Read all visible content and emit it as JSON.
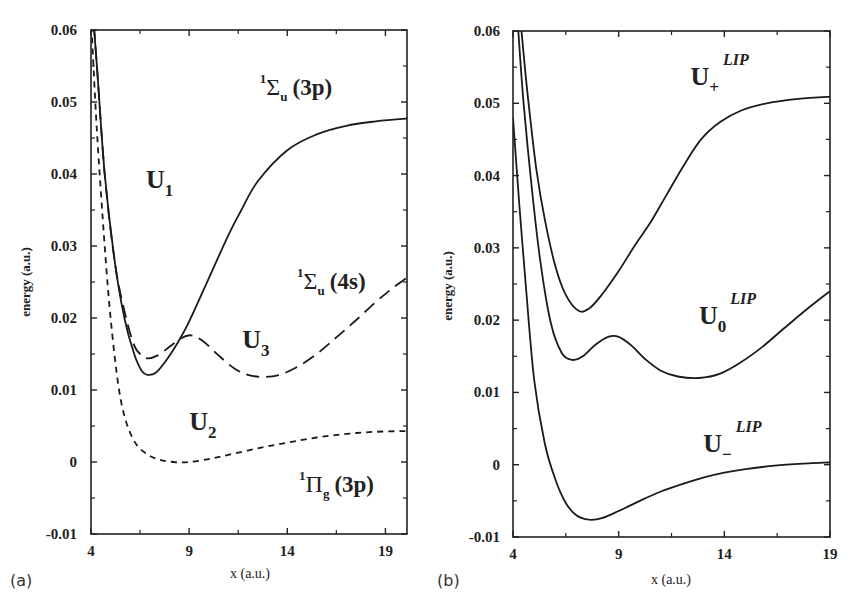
{
  "chart_data": [
    {
      "panel_label": "(a)",
      "type": "line",
      "title": "",
      "xlabel": "x (a.u.)",
      "ylabel": "energy (a.u.)",
      "xlim": [
        4,
        20.1
      ],
      "ylim": [
        -0.01,
        0.06
      ],
      "xticks": [
        4,
        9,
        14,
        19
      ],
      "yticks": [
        -0.01,
        0,
        0.01,
        0.02,
        0.03,
        0.04,
        0.05,
        0.06
      ],
      "ytick_labels": [
        "-0.01",
        "0",
        "0.01",
        "0.02",
        "0.03",
        "0.04",
        "0.05",
        "0.06"
      ],
      "grid": false,
      "legend": "none (inline curve annotations)",
      "series": [
        {
          "name": "U1",
          "state": "1Σu (3p)",
          "style": "solid",
          "x": [
            4.0,
            4.3,
            4.7,
            5.2,
            5.7,
            6.2,
            6.6,
            6.9,
            7.3,
            7.8,
            8.4,
            9.0,
            10.0,
            11.0,
            11.6,
            12.5,
            14.0,
            15.5,
            17.0,
            18.5,
            20.1
          ],
          "y": [
            0.066,
            0.055,
            0.04,
            0.028,
            0.02,
            0.015,
            0.0126,
            0.0121,
            0.0124,
            0.014,
            0.0165,
            0.0195,
            0.0255,
            0.0315,
            0.0347,
            0.039,
            0.0433,
            0.0455,
            0.0467,
            0.0473,
            0.0477
          ]
        },
        {
          "name": "U3",
          "state": "1Σu (4s)",
          "style": "long-dash",
          "x": [
            4.0,
            4.3,
            4.7,
            5.2,
            5.7,
            6.2,
            6.6,
            6.9,
            7.4,
            8.0,
            8.6,
            9.1,
            9.7,
            10.5,
            11.3,
            12.0,
            12.8,
            13.6,
            14.5,
            15.5,
            16.5,
            17.5,
            18.5,
            19.3,
            20.1
          ],
          "y": [
            0.066,
            0.055,
            0.04,
            0.028,
            0.021,
            0.0162,
            0.0148,
            0.0144,
            0.0148,
            0.016,
            0.0172,
            0.0176,
            0.0168,
            0.0148,
            0.013,
            0.0121,
            0.0118,
            0.0121,
            0.0132,
            0.015,
            0.0173,
            0.0197,
            0.0222,
            0.024,
            0.0256
          ]
        },
        {
          "name": "U2",
          "state": "1Πg (3p)",
          "style": "short-dash",
          "x": [
            4.0,
            4.3,
            4.7,
            5.0,
            5.4,
            5.8,
            6.3,
            6.9,
            7.5,
            8.2,
            9.0,
            10.0,
            11.0,
            12.5,
            14.0,
            15.5,
            17.0,
            18.5,
            20.1
          ],
          "y": [
            0.062,
            0.046,
            0.03,
            0.02,
            0.0105,
            0.0055,
            0.0025,
            0.001,
            0.0003,
            0.0,
            0.0,
            0.0004,
            0.001,
            0.0019,
            0.0027,
            0.0034,
            0.0039,
            0.0042,
            0.0043
          ]
        }
      ],
      "annotations": [
        {
          "text": "U",
          "sub": "1",
          "sup": "",
          "x": 6.8,
          "y": 0.038
        },
        {
          "text": "Σ",
          "pre_sup": "1",
          "sub": "u",
          "suffix": "(3p)",
          "x": 12.6,
          "y": 0.051
        },
        {
          "text": "U",
          "sub": "3",
          "sup": "",
          "x": 11.7,
          "y": 0.0158
        },
        {
          "text": "Σ",
          "pre_sup": "1",
          "sub": "u",
          "suffix": "(4s)",
          "x": 14.5,
          "y": 0.024
        },
        {
          "text": "U",
          "sub": "2",
          "sup": "",
          "x": 9.0,
          "y": 0.0044
        },
        {
          "text": "Π",
          "pre_sup": "1",
          "sub": "g",
          "suffix": "(3p)",
          "x": 14.6,
          "y": -0.0042
        }
      ]
    },
    {
      "panel_label": "(b)",
      "type": "line",
      "title": "",
      "xlabel": "x (a.u.)",
      "ylabel": "energy (a.u.)",
      "xlim": [
        4,
        19
      ],
      "ylim": [
        -0.01,
        0.06
      ],
      "xticks": [
        4,
        9,
        14,
        19
      ],
      "yticks": [
        -0.01,
        0,
        0.01,
        0.02,
        0.03,
        0.04,
        0.05,
        0.06
      ],
      "ytick_labels": [
        "-0.01",
        "0",
        "0.01",
        "0.02",
        "0.03",
        "0.04",
        "0.05",
        "0.06"
      ],
      "grid": false,
      "legend": "none (inline curve annotations)",
      "series": [
        {
          "name": "U+^LIP",
          "style": "solid",
          "x": [
            4.4,
            4.7,
            5.1,
            5.5,
            6.0,
            6.5,
            7.1,
            7.6,
            8.2,
            9.0,
            9.8,
            10.5,
            11.3,
            12.1,
            12.9,
            13.8,
            14.8,
            16.0,
            17.5,
            19.0
          ],
          "y": [
            0.06,
            0.051,
            0.041,
            0.034,
            0.0275,
            0.0235,
            0.0213,
            0.0216,
            0.0235,
            0.0268,
            0.0305,
            0.0335,
            0.0375,
            0.0415,
            0.045,
            0.0474,
            0.049,
            0.05,
            0.0506,
            0.0509
          ]
        },
        {
          "name": "U0^LIP",
          "style": "solid",
          "x": [
            4.25,
            4.5,
            4.9,
            5.3,
            5.8,
            6.3,
            6.8,
            7.3,
            7.9,
            8.5,
            9.0,
            9.6,
            10.3,
            11.0,
            11.8,
            12.8,
            13.8,
            14.8,
            15.8,
            16.8,
            17.9,
            19.0
          ],
          "y": [
            0.06,
            0.05,
            0.038,
            0.028,
            0.0195,
            0.0155,
            0.0145,
            0.015,
            0.0166,
            0.0177,
            0.0177,
            0.0165,
            0.0145,
            0.013,
            0.0122,
            0.012,
            0.0126,
            0.0142,
            0.0163,
            0.0188,
            0.0215,
            0.024
          ]
        },
        {
          "name": "U-^LIP",
          "style": "solid",
          "x": [
            4.0,
            4.3,
            4.6,
            5.0,
            5.5,
            6.0,
            6.5,
            7.0,
            7.6,
            8.2,
            9.0,
            10.0,
            11.0,
            12.0,
            13.0,
            14.0,
            15.0,
            16.5,
            18.0,
            19.0
          ],
          "y": [
            0.048,
            0.036,
            0.025,
            0.0118,
            0.003,
            -0.002,
            -0.0053,
            -0.007,
            -0.0076,
            -0.0074,
            -0.0064,
            -0.005,
            -0.0037,
            -0.0027,
            -0.0018,
            -0.0011,
            -0.0006,
            -0.0001,
            0.0002,
            0.0003
          ]
        }
      ],
      "annotations": [
        {
          "text": "U",
          "sub": "+",
          "sup": "LIP",
          "x": 12.4,
          "y": 0.0525
        },
        {
          "text": "U",
          "sub": "0",
          "sup": "LIP",
          "x": 12.8,
          "y": 0.0195
        },
        {
          "text": "U",
          "sub": "−",
          "sup": "LIP",
          "x": 13.0,
          "y": 0.0018
        }
      ]
    }
  ],
  "panels": [
    {
      "id": "a",
      "label": "(a)",
      "xlabel": "x (a.u.)",
      "ylabel": "energy (a.u.)"
    },
    {
      "id": "b",
      "label": "(b)",
      "xlabel": "x (a.u.)",
      "ylabel": "energy (a.u.)"
    }
  ]
}
